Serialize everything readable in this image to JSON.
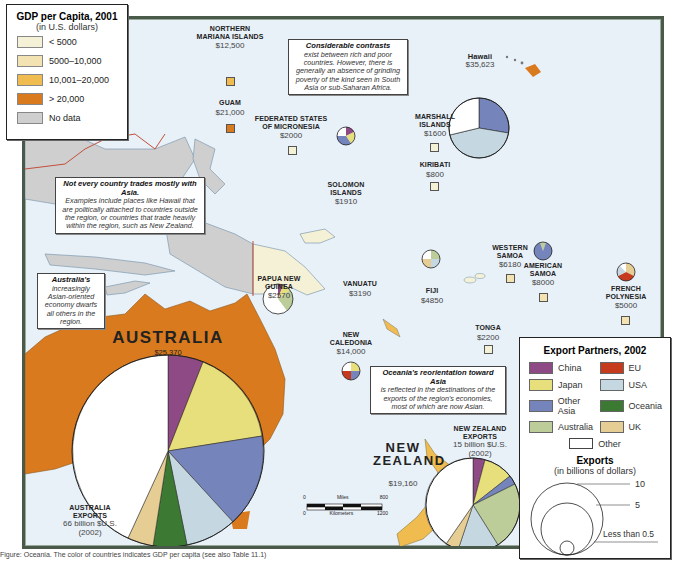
{
  "gdp_legend": {
    "title": "GDP per Capita, 2001",
    "subtitle": "(in U.S. dollars)",
    "items": [
      {
        "label": "< 5000",
        "color": "#f4f1d6"
      },
      {
        "label": "5000–10,000",
        "color": "#f3e3b2"
      },
      {
        "label": "10,001–20,000",
        "color": "#f0bc4f"
      },
      {
        "label": "> 20,000",
        "color": "#d97a1e"
      },
      {
        "label": "No data",
        "color": "#cfcfcf"
      }
    ]
  },
  "export_legend": {
    "title": "Export Partners, 2002",
    "partners": [
      {
        "label": "China",
        "color": "#8e4a85"
      },
      {
        "label": "EU",
        "color": "#c63a1e"
      },
      {
        "label": "Japan",
        "color": "#e6df7c"
      },
      {
        "label": "USA",
        "color": "#c5d8e2"
      },
      {
        "label": "Other Asia",
        "color": "#7585bb"
      },
      {
        "label": "Oceania",
        "color": "#3c7a34"
      },
      {
        "label": "Australia",
        "color": "#bccd9a"
      },
      {
        "label": "UK",
        "color": "#e6cd93"
      }
    ],
    "other_label": "Other",
    "exports_title": "Exports",
    "exports_subtitle": "(in billions of dollars)",
    "size_labels": [
      "10",
      "5",
      "Less than 0.5"
    ]
  },
  "callouts": {
    "contrasts": {
      "title": "Considerable contrasts",
      "body": "exist between rich and poor countries.  However, there is generally an absence of grinding poverty of the kind seen in South Asia or sub-Saharan Africa."
    },
    "not_asia": {
      "title": "Not every country trades mostly with Asia.",
      "body": "Examples include places like Hawaii that are politically attached to countries outside the region,  or countries that trade heavily within the region, such as New Zealand."
    },
    "australia": {
      "title": "Australia's",
      "body": "increasingly Asian-oriented economy dwarfs all others in the region."
    },
    "reorientation": {
      "title": "Oceania's reorientation toward Asia",
      "body": "is reflected in the destinations of the exports of the region's economies, most of which are now Asian."
    }
  },
  "places": {
    "northern_mariana": {
      "name": "NORTHERN MARIANA ISLANDS",
      "gdp": "$12,500"
    },
    "guam": {
      "name": "GUAM",
      "gdp": "$21,000"
    },
    "micronesia": {
      "name": "FEDERATED STATES OF MICRONESIA",
      "gdp": "$2000"
    },
    "marshall": {
      "name": "MARSHALL ISLANDS",
      "gdp": "$1600"
    },
    "kiribati": {
      "name": "KIRIBATI",
      "gdp": "$800"
    },
    "hawaii": {
      "name": "Hawaii",
      "gdp": "$35,623"
    },
    "solomon": {
      "name": "SOLOMON ISLANDS",
      "gdp": "$1910"
    },
    "png": {
      "name": "PAPUA NEW GUINEA",
      "gdp": "$2570"
    },
    "vanuatu": {
      "name": "VANUATU",
      "gdp": "$3190"
    },
    "fiji": {
      "name": "FIJI",
      "gdp": "$4850"
    },
    "western_samoa": {
      "name": "WESTERN SAMOA",
      "gdp": "$6180"
    },
    "american_samoa": {
      "name": "AMERICAN SAMOA",
      "gdp": "$8000"
    },
    "french_polynesia": {
      "name": "FRENCH POLYNESIA",
      "gdp": "$5000"
    },
    "tonga": {
      "name": "TONGA",
      "gdp": "$2200"
    },
    "new_caledonia": {
      "name": "NEW CALEDONIA",
      "gdp": "$14,000"
    },
    "australia": {
      "name": "AUSTRALIA",
      "gdp": "$25,370"
    },
    "new_zealand": {
      "name": "NEW ZEALAND",
      "gdp": "$19,160"
    }
  },
  "export_labels": {
    "australia": {
      "title": "AUSTRALIA EXPORTS",
      "amount": "66 billion $U.S.",
      "year": "(2002)"
    },
    "new_zealand": {
      "title": "NEW ZEALAND EXPORTS",
      "amount": "15 billion $U.S.",
      "year": "(2002)"
    }
  },
  "scale_bar": {
    "miles_label": "Miles",
    "miles_max": "800",
    "km_label": "Kilometers",
    "km_max": "1200",
    "zero": "0"
  },
  "caption": "Figure: Oceania. The color of countries indicates GDP per capita (see also Table 11.1)"
}
